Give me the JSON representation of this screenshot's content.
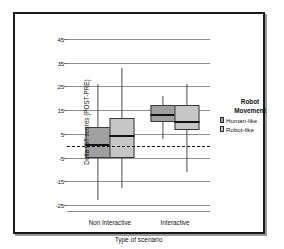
{
  "chart_data": {
    "type": "box",
    "title": "",
    "xlabel": "Type of scenario",
    "ylabel": "Delta IST scores (POST-PRE)",
    "categories": [
      "Non Interactive",
      "Interactive"
    ],
    "ylim": [
      -28,
      48
    ],
    "yticks": [
      45,
      35,
      25,
      15,
      5,
      -5,
      -15,
      -25
    ],
    "ytick_labels": [
      "45",
      "35",
      "25",
      "15",
      "5",
      "-5",
      "-15",
      "-25"
    ],
    "grid": "horizontal",
    "reference_line": {
      "value": 0,
      "style": "dashed",
      "color": "#161616"
    },
    "legend": {
      "title_line1": "Robot",
      "title_line2": "Movement",
      "position": "right",
      "entries": [
        {
          "label": "Human-like",
          "color": "#a0a0a0"
        },
        {
          "label": "Robot-like",
          "color": "#c6c6c6"
        }
      ]
    },
    "series": [
      {
        "name": "Human-like",
        "color": "#a0a0a0",
        "boxes": [
          {
            "category": "Non Interactive",
            "whisker_low": -23,
            "q1": -5,
            "median": 0.5,
            "q3": 8,
            "whisker_high": 26
          },
          {
            "category": "Interactive",
            "whisker_low": 3,
            "q1": 10,
            "median": 13,
            "q3": 17,
            "whisker_high": 21
          }
        ]
      },
      {
        "name": "Robot-like",
        "color": "#c6c6c6",
        "boxes": [
          {
            "category": "Non Interactive",
            "whisker_low": -18,
            "q1": -5,
            "median": 4,
            "q3": 11.5,
            "whisker_high": 33
          },
          {
            "category": "Interactive",
            "whisker_low": -11,
            "q1": 6.5,
            "median": 10,
            "q3": 17,
            "whisker_high": 26
          }
        ]
      }
    ]
  }
}
